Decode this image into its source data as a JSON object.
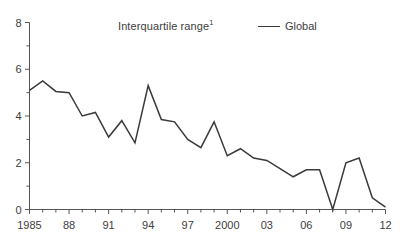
{
  "header": {
    "title": "Interquartile range",
    "title_footnote": "1"
  },
  "legend": {
    "entries": [
      {
        "label": "Global",
        "color": "#3a3a3a",
        "marker": "line-swatch"
      }
    ]
  },
  "axes": {
    "y_ticks_major": [
      "0",
      "2",
      "4",
      "6",
      "8"
    ],
    "y_ticks_minor": [
      "1",
      "3",
      "5",
      "7"
    ],
    "x_ticks_major": [
      "1985",
      "88",
      "91",
      "94",
      "97",
      "2000",
      "03",
      "06",
      "09",
      "12"
    ]
  },
  "chart_data": {
    "type": "line",
    "xlabel": "",
    "ylabel": "",
    "xlim": [
      1985,
      2012
    ],
    "ylim": [
      0,
      8
    ],
    "ytick_values": [
      0,
      2,
      4,
      6,
      8
    ],
    "ytick_minor_values": [
      1,
      3,
      5,
      7
    ],
    "xtick_values": [
      1985,
      1988,
      1991,
      1994,
      1997,
      2000,
      2003,
      2006,
      2009,
      2012
    ],
    "xtick_labels": [
      "1985",
      "88",
      "91",
      "94",
      "97",
      "2000",
      "03",
      "06",
      "09",
      "12"
    ],
    "xtick_minor_values": [
      1986,
      1987,
      1989,
      1990,
      1992,
      1993,
      1995,
      1996,
      1998,
      1999,
      2001,
      2002,
      2004,
      2005,
      2007,
      2008,
      2010,
      2011
    ],
    "grid": false,
    "legend_position": "top-right",
    "x": [
      1985,
      1986,
      1987,
      1988,
      1989,
      1990,
      1991,
      1992,
      1993,
      1994,
      1995,
      1996,
      1997,
      1998,
      1999,
      2000,
      2001,
      2002,
      2003,
      2004,
      2005,
      2006,
      2007,
      2008,
      2009,
      2010,
      2011,
      2012
    ],
    "series": [
      {
        "name": "Global",
        "color": "#3a3a3a",
        "values": [
          5.1,
          5.5,
          5.05,
          5.0,
          4.0,
          4.15,
          3.1,
          3.8,
          2.85,
          5.3,
          3.85,
          3.75,
          3.0,
          2.65,
          3.75,
          2.3,
          2.6,
          2.2,
          2.1,
          1.75,
          1.4,
          1.7,
          1.7,
          0.0,
          2.0,
          2.2,
          0.5,
          0.1
        ]
      }
    ]
  }
}
